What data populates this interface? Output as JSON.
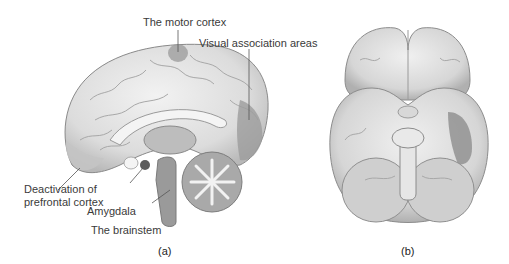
{
  "figure": {
    "panels": [
      {
        "id": "a",
        "label": "(a)",
        "view": "medial sagittal view of brain",
        "annotations": [
          {
            "text": "The motor cortex"
          },
          {
            "text": "Visual association areas"
          },
          {
            "text_line1": "Deactivation of",
            "text_line2": "prefrontal cortex"
          },
          {
            "text": "Amygdala"
          },
          {
            "text": "The brainstem"
          }
        ]
      },
      {
        "id": "b",
        "label": "(b)",
        "view": "inferior view of brain"
      }
    ],
    "colors": {
      "background": "#ffffff",
      "brain_light": "#e9e9e9",
      "brain_mid": "#c8c8c8",
      "brain_shade": "#9a9a9a",
      "highlight_dark": "#7f7f7f",
      "line": "#555555",
      "text": "#3a3a3a"
    }
  }
}
